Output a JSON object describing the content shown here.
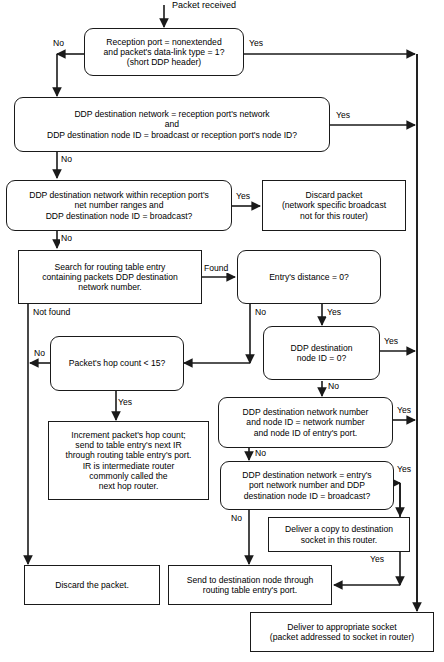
{
  "diagram": {
    "start_label": "Packet received",
    "nodes": [
      {
        "id": "n1",
        "shape": "decision",
        "text": "Reception port = nonextended\nand packet's data-link type = 1?\n(short DDP header)"
      },
      {
        "id": "n2",
        "shape": "decision",
        "text": "DDP destination network = reception port's network\nand\nDDP destination node ID = broadcast or reception port's node ID?"
      },
      {
        "id": "n3",
        "shape": "decision",
        "text": "DDP destination network within reception port's\nnet number ranges and\nDDP destination node ID = broadcast?"
      },
      {
        "id": "n4",
        "shape": "process",
        "text": "Discard packet\n(network specific broadcast\nnot for this router)"
      },
      {
        "id": "n5",
        "shape": "process",
        "text": "Search for routing table entry\ncontaining packets DDP destination\nnetwork number."
      },
      {
        "id": "n6",
        "shape": "decision",
        "text": "Entry's distance = 0?"
      },
      {
        "id": "n7",
        "shape": "decision",
        "text": "DDP destination\nnode ID = 0?"
      },
      {
        "id": "n8",
        "shape": "decision",
        "text": "Packet's hop count < 15?"
      },
      {
        "id": "n9",
        "shape": "decision",
        "text": "DDP destination network number\nand node ID = network number\nand node ID of entry's port."
      },
      {
        "id": "n10",
        "shape": "process",
        "text": "Increment packet's hop count;\nsend to table entry's next IR\nthrough routing table entry's port.\nIR is intermediate router\ncommonly called the\nnext hop router."
      },
      {
        "id": "n11",
        "shape": "decision",
        "text": "DDP destination network = entry's\nport network number and DDP\ndestination node ID = broadcast?"
      },
      {
        "id": "n12",
        "shape": "process",
        "text": "Deliver a copy to destination\nsocket in this router."
      },
      {
        "id": "n13",
        "shape": "process",
        "text": "Discard the packet."
      },
      {
        "id": "n14",
        "shape": "process",
        "text": "Send to destination node through\nrouting table entry's port."
      },
      {
        "id": "n15",
        "shape": "process",
        "text": "Deliver to appropriate socket\n(packet addressed to socket in router)"
      }
    ],
    "edge_labels": [
      {
        "id": "e1",
        "text": "No"
      },
      {
        "id": "e2",
        "text": "Yes"
      },
      {
        "id": "e3",
        "text": "Yes"
      },
      {
        "id": "e4",
        "text": "No"
      },
      {
        "id": "e5",
        "text": "Yes"
      },
      {
        "id": "e6",
        "text": "No"
      },
      {
        "id": "e7",
        "text": "Found"
      },
      {
        "id": "e8",
        "text": "Not found"
      },
      {
        "id": "e9",
        "text": "No"
      },
      {
        "id": "e10",
        "text": "Yes"
      },
      {
        "id": "e11",
        "text": "Yes"
      },
      {
        "id": "e12",
        "text": "No"
      },
      {
        "id": "e13",
        "text": "No"
      },
      {
        "id": "e14",
        "text": "Yes"
      },
      {
        "id": "e15",
        "text": "Yes"
      },
      {
        "id": "e16",
        "text": "No"
      },
      {
        "id": "e17",
        "text": "Yes"
      },
      {
        "id": "e18",
        "text": "No"
      },
      {
        "id": "e19",
        "text": "Yes"
      }
    ],
    "colors": {
      "stroke": "#1a1a1a",
      "background": "#ffffff",
      "text": "#000000"
    }
  }
}
